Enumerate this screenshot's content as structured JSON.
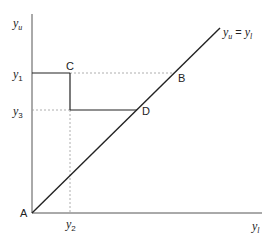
{
  "diagram": {
    "axes": {
      "y_label": {
        "base": "y",
        "sub": "u"
      },
      "x_label": {
        "base": "y",
        "sub": "l"
      }
    },
    "diagonal_label": {
      "lhs_base": "y",
      "lhs_sub": "u",
      "eq": "=",
      "rhs_base": "y",
      "rhs_sub": "l"
    },
    "ticks": {
      "y1": {
        "base": "y",
        "sub": "1"
      },
      "y3": {
        "base": "y",
        "sub": "3"
      },
      "y2": {
        "base": "y",
        "sub": "2"
      }
    },
    "points": {
      "A": "A",
      "B": "B",
      "C": "C",
      "D": "D"
    },
    "colors": {
      "line": "#222222",
      "axis": "#555555",
      "dashed": "#999999"
    }
  }
}
